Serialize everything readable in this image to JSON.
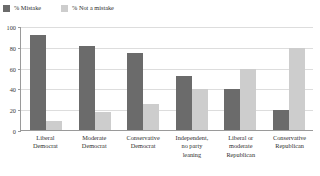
{
  "legend": {
    "position": "top-left",
    "entries": [
      {
        "label": "% Mistake",
        "icon": "square-swatch-icon",
        "color": "#6b6b6b"
      },
      {
        "label": "% Not a mistake",
        "icon": "square-swatch-icon",
        "color": "#cdcdcd"
      }
    ]
  },
  "axis": {
    "yticks": [
      "100",
      "80",
      "60",
      "40",
      "20",
      "0"
    ],
    "ytick_values": [
      100,
      80,
      60,
      40,
      20,
      0
    ]
  },
  "chart_data": {
    "type": "bar",
    "title": "",
    "subtitle": "",
    "xlabel": "",
    "ylabel": "",
    "ylim": [
      0,
      100
    ],
    "grid": true,
    "legend_position": "top-left",
    "categories": [
      "Liberal\nDemocrat",
      "Moderate\nDemocrat",
      "Conservative\nDemocrat",
      "Independent,\nno party\nleaning",
      "Liberal or\nmoderate\nRepublican",
      "Conservative\nRepublican"
    ],
    "series": [
      {
        "name": "% Mistake",
        "color": "#6b6b6b",
        "values": [
          91,
          81,
          74,
          52,
          39,
          19
        ]
      },
      {
        "name": "% Not a mistake",
        "color": "#cdcdcd",
        "values": [
          9,
          17,
          25,
          39,
          59,
          79
        ]
      }
    ]
  }
}
